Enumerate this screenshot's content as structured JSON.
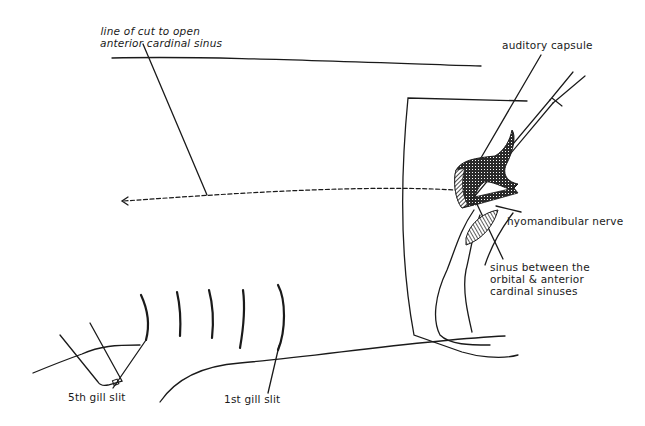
{
  "figure": {
    "type": "anatomical dissection diagram",
    "line_color": "#1a1a1a",
    "labels": {
      "line_of_cut": [
        "line of cut to open",
        "anterior cardinal sinus"
      ],
      "auditory_capsule": "auditory capsule",
      "hyomandibular_nerve": "hyomandibular nerve",
      "sinus_between": [
        "sinus between the",
        "orbital & anterior",
        "cardinal sinuses"
      ],
      "fifth_gill_slit": "5th gill slit",
      "first_gill_slit": "1st gill slit"
    }
  }
}
